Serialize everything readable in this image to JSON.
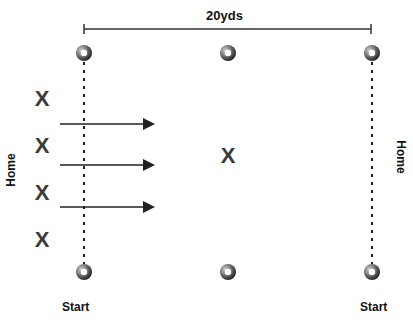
{
  "diagram": {
    "distance_label": "20yds",
    "left_side_label": "Home",
    "right_side_label": "Home",
    "start_left": "Start",
    "start_right": "Start",
    "player_mark": "X",
    "cones": [
      {
        "x": 84,
        "y": 53
      },
      {
        "x": 228,
        "y": 53
      },
      {
        "x": 372,
        "y": 53
      },
      {
        "x": 84,
        "y": 272
      },
      {
        "x": 228,
        "y": 272
      },
      {
        "x": 372,
        "y": 272
      }
    ],
    "players_left": [
      {
        "x": 42,
        "y": 99
      },
      {
        "x": 42,
        "y": 146
      },
      {
        "x": 42,
        "y": 193
      },
      {
        "x": 42,
        "y": 240
      }
    ],
    "player_center": {
      "x": 228,
      "y": 156
    },
    "arrows": [
      {
        "x1": 60,
        "x2": 157,
        "y": 124
      },
      {
        "x1": 60,
        "x2": 157,
        "y": 165
      },
      {
        "x1": 60,
        "x2": 157,
        "y": 207
      }
    ],
    "colors": {
      "line": "#222222",
      "mark": "#3a3a3a",
      "cone": "#555555"
    }
  }
}
